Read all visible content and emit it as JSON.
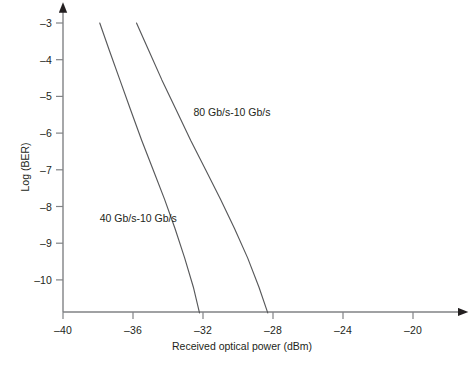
{
  "chart_data": {
    "type": "line",
    "title": "",
    "xlabel": "Received optical power (dBm)",
    "ylabel": "Log (BER)",
    "xlim": [
      -40,
      -19
    ],
    "ylim": [
      -10.9,
      -3
    ],
    "xticks": [
      -40,
      -36,
      -32,
      -28,
      -24,
      -20
    ],
    "xtick_labels": [
      "–40",
      "–36",
      "–32",
      "–28",
      "–24",
      "–20"
    ],
    "yticks": [
      -3,
      -4,
      -5,
      -6,
      -7,
      -8,
      -9,
      -10
    ],
    "ytick_labels": [
      "–3",
      "–4",
      "–5",
      "–6",
      "–7",
      "–8",
      "–9",
      "–10"
    ],
    "grid": false,
    "legend": "inline-annotations",
    "line_color": "#58595b",
    "axis_color": "#808285",
    "text_color": "#231f20",
    "background": "#ffffff",
    "series": [
      {
        "name": "40 Gb/s-10 Gb/s",
        "label": "40 Gb/s-10 Gb/s",
        "label_x": -37.9,
        "label_y": -8.34,
        "x": [
          -37.9,
          -37.35,
          -36.75,
          -36.15,
          -35.5,
          -34.85,
          -34.2,
          -33.6,
          -33.05,
          -32.55,
          -32.2
        ],
        "y": [
          -3.0,
          -3.75,
          -4.55,
          -5.35,
          -6.2,
          -7.0,
          -7.8,
          -8.6,
          -9.4,
          -10.2,
          -10.9
        ]
      },
      {
        "name": "80 Gb/s-10 Gb/s",
        "label": "80 Gb/s-10 Gb/s",
        "label_x": -32.55,
        "label_y": -5.44,
        "x": [
          -35.8,
          -35.1,
          -34.35,
          -33.55,
          -32.7,
          -31.85,
          -31.0,
          -30.2,
          -29.45,
          -28.8,
          -28.3
        ],
        "y": [
          -3.0,
          -3.75,
          -4.55,
          -5.35,
          -6.2,
          -7.0,
          -7.8,
          -8.6,
          -9.4,
          -10.2,
          -10.9
        ]
      }
    ]
  }
}
